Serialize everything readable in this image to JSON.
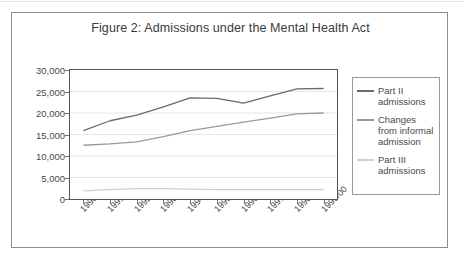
{
  "figure": {
    "title": "Figure 2: Admissions under the Mental Health Act"
  },
  "chart_data": {
    "type": "line",
    "title": "Figure 2: Admissions under the Mental Health Act",
    "xlabel": "",
    "ylabel": "",
    "ylim": [
      0,
      30000
    ],
    "ytick_labels": [
      "30,000",
      "25,000",
      "20,000",
      "15,000",
      "10,000",
      "5,000",
      "0"
    ],
    "ytick_values": [
      30000,
      25000,
      20000,
      15000,
      10000,
      5000,
      0
    ],
    "grid": true,
    "legend_position": "right",
    "categories": [
      "1990/91",
      "1991/2",
      "1992/3",
      "1993/4",
      "1994/5",
      "1995/6",
      "1996/7",
      "1997/8",
      "1998/99",
      "1999/00"
    ],
    "series": [
      {
        "name": "Part II admissions",
        "color": "#6b6b6b",
        "values": [
          15900,
          18200,
          19500,
          21400,
          23500,
          23400,
          22300,
          24000,
          25600,
          25700
        ]
      },
      {
        "name": "Changes from informal admission",
        "color": "#9a9a9a",
        "values": [
          12500,
          12800,
          13300,
          14500,
          15900,
          16900,
          17900,
          18800,
          19800,
          20000
        ]
      },
      {
        "name": "Part III admissions",
        "color": "#d0d0d0",
        "values": [
          1900,
          2200,
          2400,
          2400,
          2300,
          2200,
          2200,
          2200,
          2200,
          2200
        ]
      }
    ]
  },
  "legend": {
    "items": [
      {
        "label": "Part II admissions",
        "color": "#6b6b6b"
      },
      {
        "label": "Changes from informal admission",
        "color": "#9a9a9a"
      },
      {
        "label": "Part III admissions",
        "color": "#d0d0d0"
      }
    ]
  }
}
